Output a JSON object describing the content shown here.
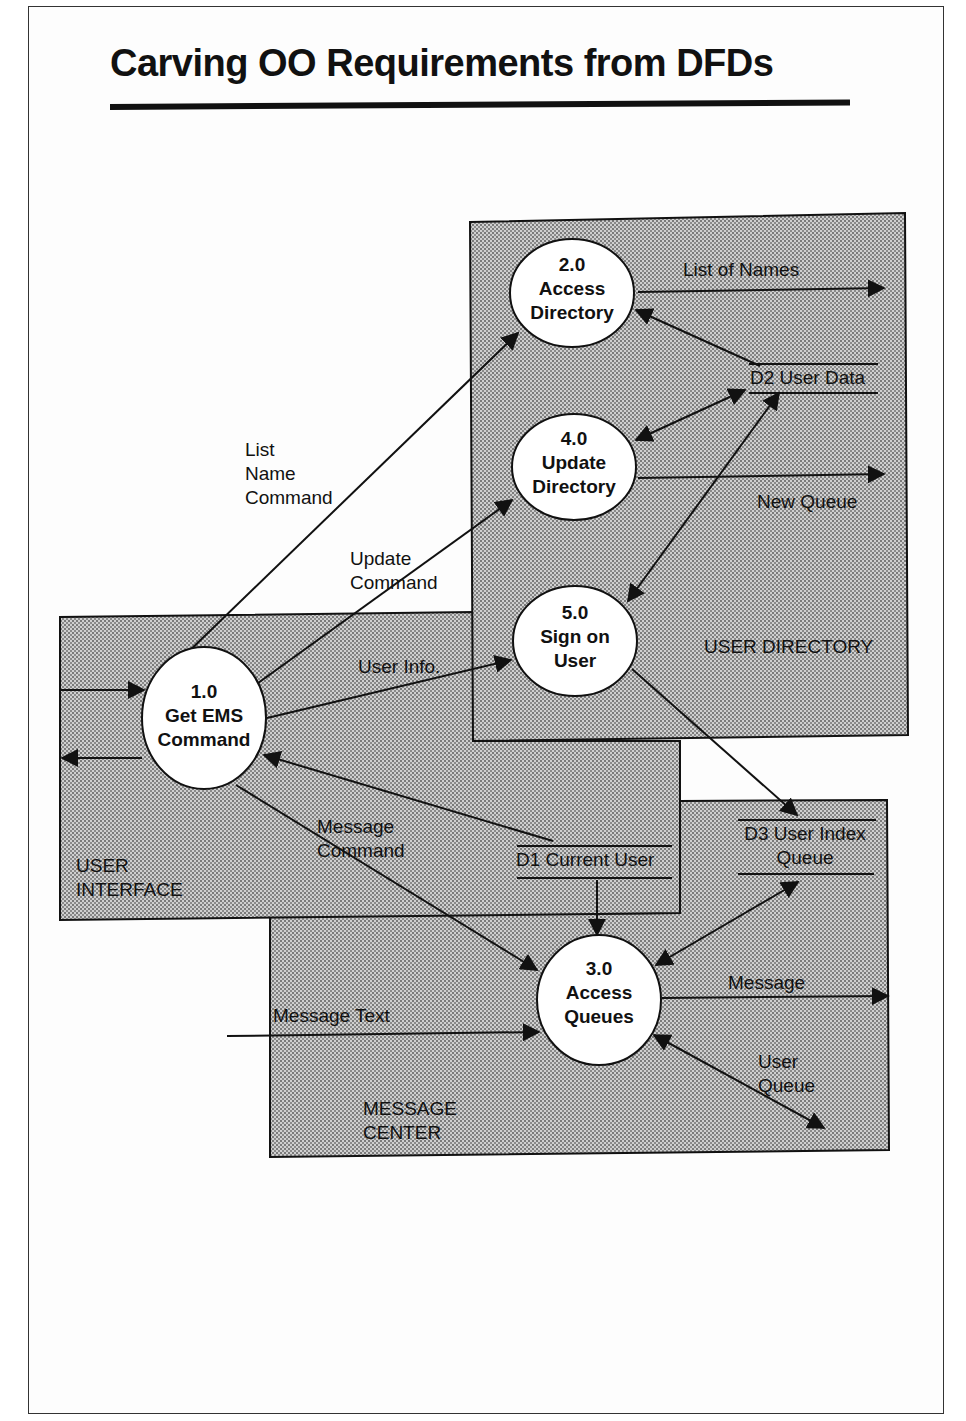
{
  "title": "Carving OO Requirements from DFDs",
  "colors": {
    "ink": "#111111",
    "hatch_fill": "#c8c8c8",
    "hatch_dot": "#7a7a7a",
    "paper": "#ffffff"
  },
  "regions": {
    "user_directory": {
      "label": "USER DIRECTORY"
    },
    "user_interface": {
      "label_line1": "USER",
      "label_line2": "INTERFACE"
    },
    "message_center": {
      "label_line1": "MESSAGE",
      "label_line2": "CENTER"
    }
  },
  "processes": {
    "p1": {
      "id": "1.0",
      "line1": "Get EMS",
      "line2": "Command"
    },
    "p2": {
      "id": "2.0",
      "line1": "Access",
      "line2": "Directory"
    },
    "p3": {
      "id": "3.0",
      "line1": "Access",
      "line2": "Queues"
    },
    "p4": {
      "id": "4.0",
      "line1": "Update",
      "line2": "Directory"
    },
    "p5": {
      "id": "5.0",
      "line1": "Sign on",
      "line2": "User"
    }
  },
  "data_stores": {
    "d1": {
      "label": "D1 Current User"
    },
    "d2": {
      "label": "D2 User Data"
    },
    "d3": {
      "line1": "D3 User Index",
      "line2": "Queue"
    }
  },
  "flows": {
    "list_name_command": {
      "line1": "List",
      "line2": "Name",
      "line3": "Command"
    },
    "update_command": {
      "line1": "Update",
      "line2": "Command"
    },
    "user_info": {
      "label": "User Info."
    },
    "message_command": {
      "line1": "Message",
      "line2": "Command"
    },
    "list_of_names": {
      "label": "List of Names"
    },
    "new_queue": {
      "label": "New Queue"
    },
    "message_text": {
      "label": "Message Text"
    },
    "message": {
      "label": "Message"
    },
    "user_queue": {
      "line1": "User",
      "line2": "Queue"
    }
  }
}
